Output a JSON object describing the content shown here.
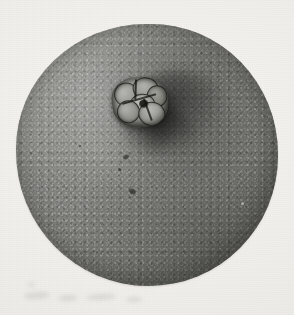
{
  "plate": {
    "kind": "halftone-photograph",
    "subject": "navel orange",
    "view": "navel (stylar) end, whole fruit",
    "caption": "",
    "background_color": "#f2f1ee",
    "has_border": false,
    "has_text": false,
    "width_px": 294,
    "height_px": 315
  },
  "fruit": {
    "name": "orange",
    "outline": "slightly irregular circle",
    "center_x_px": 147,
    "center_y_px": 155,
    "radius_px": 131,
    "surface": "pebbled rind with oil-gland pitting",
    "tone_light": "#a2a29e",
    "tone_mid": "#8f8f8b",
    "tone_dark": "#6f6f6b",
    "highlight_region": "upper-left",
    "shadow_region": "lower-right"
  },
  "navel": {
    "label": "navel",
    "description": "protruding cluster of small secondary-fruit lobes",
    "center_x_px": 140,
    "center_y_px": 102,
    "width_px": 56,
    "height_px": 50,
    "lobe_count": 6,
    "lobe_tone": "#c4c4bf",
    "crevice_tone": "#1c1c1a",
    "depression_direction": "down and to the right"
  },
  "blemishes": {
    "count": 5,
    "note": "small dark specks on rind below and left of the navel"
  },
  "paper_marks": {
    "count": 5,
    "note": "faint smudges along the lower-left margin"
  }
}
